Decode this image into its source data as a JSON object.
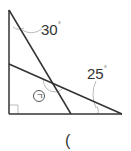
{
  "diagram": {
    "type": "geometry",
    "angles": [
      {
        "id": "top",
        "label": "30°",
        "value": "30",
        "unit": "°"
      },
      {
        "id": "right",
        "label": "25°",
        "value": "25",
        "unit": "°"
      },
      {
        "id": "unknown",
        "label": "ㄱ"
      }
    ],
    "right_angle_marker": true,
    "answer_blank": "("
  },
  "colors": {
    "line": "#333333",
    "arc": "#bbbbbb",
    "background": "#ffffff"
  }
}
